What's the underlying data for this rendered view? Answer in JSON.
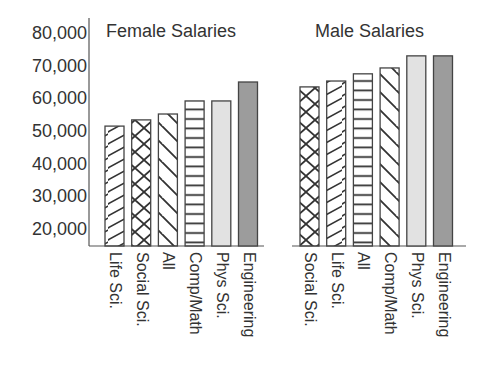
{
  "chart_data": {
    "type": "bar",
    "title": "",
    "xlabel": "",
    "ylabel": "",
    "ylim": [
      15000,
      80000
    ],
    "yticks": [
      20000,
      30000,
      40000,
      50000,
      60000,
      70000,
      80000
    ],
    "ytick_labels": [
      "20,000",
      "30,000",
      "40,000",
      "50,000",
      "60,000",
      "70,000",
      "80,000"
    ],
    "grid": false,
    "legend": null,
    "groups": [
      {
        "name": "Female Salaries",
        "categories": [
          "Life Sci.",
          "Social Sci.",
          "All",
          "Comp/Math",
          "Phys Sci.",
          "Engineering"
        ],
        "values": [
          51500,
          53400,
          55200,
          59200,
          59200,
          65000
        ],
        "patterns": [
          "diag-up",
          "crosshatch",
          "diag-down",
          "horizontal",
          "light-gray",
          "dark-gray"
        ]
      },
      {
        "name": "Male Salaries",
        "categories": [
          "Social Sci.",
          "Life Sci.",
          "All",
          "Comp/Math",
          "Phys Sci.",
          "Engineering"
        ],
        "values": [
          63500,
          65300,
          67500,
          69300,
          73000,
          73000
        ],
        "patterns": [
          "crosshatch",
          "diag-up",
          "horizontal",
          "diag-down",
          "light-gray",
          "dark-gray"
        ]
      }
    ]
  },
  "colors": {
    "axis": "#555555",
    "bar_outline": "#444444",
    "hatch": "#333333",
    "light_gray": "#e2e2e2",
    "dark_gray": "#9c9c9c"
  }
}
